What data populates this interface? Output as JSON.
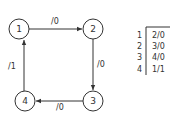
{
  "diagram": {
    "type": "state-transition",
    "nodes": [
      {
        "id": "1",
        "label": "1",
        "x": 19,
        "y": 29
      },
      {
        "id": "2",
        "label": "2",
        "x": 93,
        "y": 29
      },
      {
        "id": "3",
        "label": "3",
        "x": 93,
        "y": 101
      },
      {
        "id": "4",
        "label": "4",
        "x": 25,
        "y": 101
      }
    ],
    "edges": [
      {
        "from": "1",
        "to": "2",
        "label": "/0"
      },
      {
        "from": "2",
        "to": "3",
        "label": "/0"
      },
      {
        "from": "3",
        "to": "4",
        "label": "/0"
      },
      {
        "from": "4",
        "to": "1",
        "label": "/1"
      }
    ],
    "table": {
      "rows": [
        {
          "state": "1",
          "next": "2/0"
        },
        {
          "state": "2",
          "next": "3/0"
        },
        {
          "state": "3",
          "next": "4/0"
        },
        {
          "state": "4",
          "next": "1/1"
        }
      ]
    }
  }
}
